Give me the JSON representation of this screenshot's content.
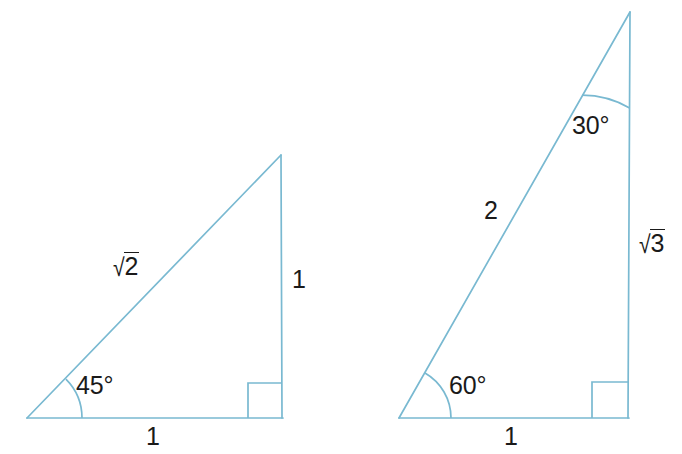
{
  "figure": {
    "stroke_color": "#79b9d1",
    "text_color": "#1a1a1a",
    "background": "#ffffff",
    "stroke_width": 1.6
  },
  "triangles": [
    {
      "name": "triangle-45-45-90",
      "vertices": {
        "bottom_left": {
          "x": 27,
          "y": 418
        },
        "bottom_right": {
          "x": 283,
          "y": 418
        },
        "top_right": {
          "x": 281,
          "y": 155
        }
      },
      "right_angle_marker": {
        "x": 248,
        "y": 383,
        "size": 35
      },
      "angle_arc": {
        "cx": 27,
        "cy": 418,
        "radius": 55,
        "from_deg": 0,
        "to_deg": 45
      },
      "labels": {
        "angle": "45°",
        "hypotenuse_radicand": "2",
        "hypotenuse_symbol": "√",
        "vertical_side": "1",
        "base_side": "1"
      }
    },
    {
      "name": "triangle-30-60-90",
      "vertices": {
        "bottom_left": {
          "x": 399,
          "y": 418
        },
        "bottom_right": {
          "x": 628,
          "y": 418
        },
        "top_right": {
          "x": 630,
          "y": 12
        }
      },
      "right_angle_marker": {
        "x": 592,
        "y": 383,
        "size": 36
      },
      "angle_arc_bottom": {
        "cx": 399,
        "cy": 418,
        "radius": 52,
        "from_deg": 0,
        "to_deg": 60
      },
      "angle_arc_top": {
        "cx": 630,
        "cy": 12,
        "radius": 96,
        "from_deg": 0,
        "to_deg": 30
      },
      "labels": {
        "angle_bottom": "60°",
        "angle_top": "30°",
        "hypotenuse": "2",
        "vertical_side_radicand": "3",
        "vertical_side_symbol": "√",
        "base_side": "1"
      }
    }
  ],
  "label_positions": {
    "left_sqrt2": {
      "x": 112,
      "y": 252
    },
    "left_one_vertical": {
      "x": 292,
      "y": 267
    },
    "left_one_base": {
      "x": 146,
      "y": 424
    },
    "left_45": {
      "x": 76,
      "y": 373
    },
    "right_two": {
      "x": 484,
      "y": 198
    },
    "right_sqrt3": {
      "x": 638,
      "y": 229
    },
    "right_one_base": {
      "x": 504,
      "y": 424
    },
    "right_60": {
      "x": 449,
      "y": 373
    },
    "right_30": {
      "x": 572,
      "y": 113
    }
  }
}
